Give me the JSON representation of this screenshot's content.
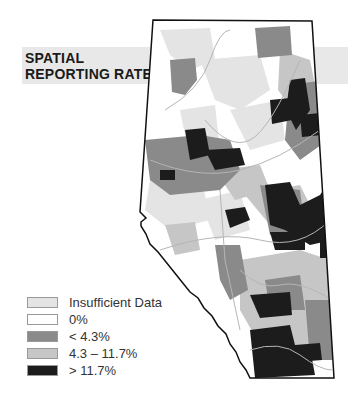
{
  "title": {
    "line1": "SPATIAL",
    "line2": "REPORTING RATE"
  },
  "legend": {
    "items": [
      {
        "label": "Insufficient Data",
        "color": "#e4e4e4"
      },
      {
        "label": "0%",
        "color": "#ffffff"
      },
      {
        "label": "< 4.3%",
        "color": "#8a8a8a"
      },
      {
        "label": "4.3 – 11.7%",
        "color": "#c6c6c6"
      },
      {
        "label": "> 11.7%",
        "color": "#1c1c1c"
      }
    ]
  },
  "colors": {
    "insufficient": "#e4e4e4",
    "zero": "#ffffff",
    "low": "#8a8a8a",
    "mid": "#c6c6c6",
    "high": "#1c1c1c",
    "border": "#111111",
    "rivers": "#b5b5b5",
    "title_band": "#e8e8e8"
  }
}
